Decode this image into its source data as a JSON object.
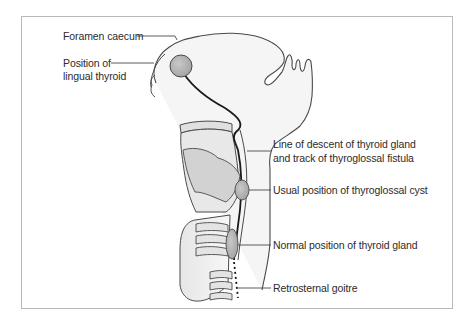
{
  "figure": {
    "labels": {
      "foramen_caecum": "Foramen caecum",
      "lingual_thyroid_line1": "Position of",
      "lingual_thyroid_line2": "lingual thyroid",
      "line_of_descent_line1": "Line of descent of thyroid gland",
      "line_of_descent_line2": "and track of thyroglossal fistula",
      "thyroglossal_cyst": "Usual position of thyroglossal cyst",
      "normal_thyroid": "Normal position of thyroid gland",
      "retrosternal_goitre": "Retrosternal goitre"
    },
    "colors": {
      "outline": "#4a4a4a",
      "track": "#1a1a1a",
      "gland_fill": "#b5b5b5",
      "tissue_fill": "#f2f2f2",
      "cartilage_fill": "#dcdcdc",
      "frame": "#b9b9b9",
      "text": "#2b2b2b"
    }
  }
}
